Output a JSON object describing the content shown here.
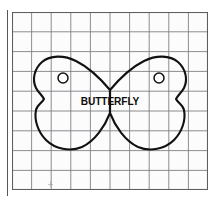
{
  "page": {
    "background_color": "#ffffff",
    "width": 220,
    "height": 208
  },
  "margin_rule": {
    "name": "left-margin-rule",
    "color": "#55565a",
    "x": 7,
    "y_top": 10,
    "y_bottom": 196
  },
  "grid": {
    "name": "graph-paper-grid",
    "columns": 10,
    "rows": 9,
    "cell_size_px": 19.6,
    "line_color": "#7e8084",
    "edge_color": "#5c5e62",
    "fill_color": "#fcfcfc",
    "left": 12,
    "top": 12,
    "width": 196,
    "height": 178
  },
  "artwork": {
    "name": "butterfly-pattern",
    "outline_color": "#111111",
    "outline_width": 2.1,
    "label": "BUTTERFLY",
    "holes": [
      {
        "name": "left-wing-hole",
        "cx": 63,
        "cy": 78,
        "r": 5
      },
      {
        "name": "right-wing-hole",
        "cx": 159,
        "cy": 78,
        "r": 5
      }
    ],
    "center_waist": {
      "top_y": 90,
      "bottom_y": 113,
      "x": 110
    }
  },
  "marks": {
    "pencil_mark": {
      "name": "pencil-tick-mark",
      "x": 48,
      "y": 181
    }
  }
}
